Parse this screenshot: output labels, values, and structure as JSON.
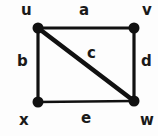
{
  "figure": {
    "kind": "undirected-graph-diagram",
    "background_color": "#fdfdfd",
    "ink_color": "#111111",
    "width": 158,
    "height": 136
  },
  "vertices": [
    {
      "id": "u",
      "label": "u",
      "cx": 38,
      "cy": 28,
      "r": 5.5
    },
    {
      "id": "v",
      "label": "v",
      "cx": 134,
      "cy": 28,
      "r": 5.5
    },
    {
      "id": "x",
      "label": "x",
      "cx": 38,
      "cy": 102,
      "r": 5.5
    },
    {
      "id": "w",
      "label": "w",
      "cx": 134,
      "cy": 101,
      "r": 5.5
    }
  ],
  "edges": [
    {
      "id": "a",
      "label": "a",
      "from": "u",
      "to": "v",
      "x1": 38,
      "y1": 28,
      "x2": 134,
      "y2": 28,
      "width": 3.2
    },
    {
      "id": "b",
      "label": "b",
      "from": "u",
      "to": "x",
      "x1": 38,
      "y1": 28,
      "x2": 38,
      "y2": 102,
      "width": 3.2
    },
    {
      "id": "c",
      "label": "c",
      "from": "u",
      "to": "w",
      "x1": 38,
      "y1": 28,
      "x2": 134,
      "y2": 101,
      "width": 4.6
    },
    {
      "id": "d",
      "label": "d",
      "from": "v",
      "to": "w",
      "x1": 134,
      "y1": 28,
      "x2": 134,
      "y2": 101,
      "width": 3.2
    },
    {
      "id": "e",
      "label": "e",
      "from": "x",
      "to": "w",
      "x1": 38,
      "y1": 102,
      "x2": 134,
      "y2": 101,
      "width": 2.6
    }
  ],
  "labels": {
    "u": "u",
    "v": "v",
    "x": "x",
    "w": "w",
    "a": "a",
    "b": "b",
    "c": "c",
    "d": "d",
    "e": "e"
  }
}
